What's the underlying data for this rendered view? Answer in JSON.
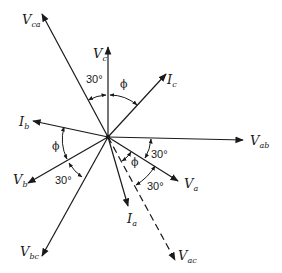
{
  "diagram": {
    "type": "phasor-diagram",
    "colors": {
      "line": "#1a1a1a",
      "background": "#ffffff"
    },
    "origin": {
      "x": 108,
      "y": 137
    },
    "phasors": [
      {
        "id": "V_ab",
        "main": "V",
        "sub": "ab",
        "style": "solid"
      },
      {
        "id": "V_c",
        "main": "V",
        "sub": "c",
        "style": "solid"
      },
      {
        "id": "V_ca",
        "main": "V",
        "sub": "ca",
        "style": "solid"
      },
      {
        "id": "I_c",
        "main": "I",
        "sub": "c",
        "style": "solid"
      },
      {
        "id": "I_b",
        "main": "I",
        "sub": "b",
        "style": "solid"
      },
      {
        "id": "V_b",
        "main": "V",
        "sub": "b",
        "style": "solid"
      },
      {
        "id": "V_bc",
        "main": "V",
        "sub": "bc",
        "style": "solid"
      },
      {
        "id": "I_a",
        "main": "I",
        "sub": "a",
        "style": "solid"
      },
      {
        "id": "V_a",
        "main": "V",
        "sub": "a",
        "style": "solid"
      },
      {
        "id": "V_ac",
        "main": "V",
        "sub": "ac",
        "style": "dashed"
      }
    ],
    "angle_labels": {
      "top_30": "30°",
      "top_phi": "ϕ",
      "left_phi": "ϕ",
      "left_30": "30°",
      "right_30_upper": "30°",
      "right_phi": "ϕ",
      "right_30_lower": "30°"
    }
  }
}
